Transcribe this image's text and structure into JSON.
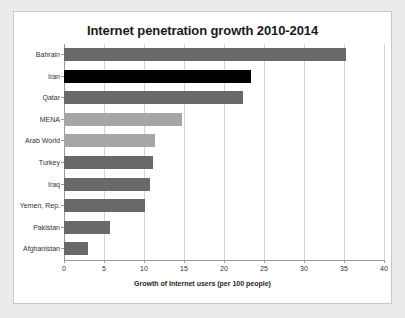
{
  "chart_data": {
    "type": "bar",
    "orientation": "horizontal",
    "title": "Internet penetration growth 2010-2014",
    "xlabel": "Growth of Internet users (per 100 people)",
    "ylabel": "",
    "xlim": [
      0,
      40
    ],
    "xticks": [
      "0",
      "5",
      "10",
      "15",
      "20",
      "25",
      "30",
      "35",
      "40"
    ],
    "grid": true,
    "legend": "none",
    "categories": [
      "Bahrain",
      "Iran",
      "Qatar",
      "MENA",
      "Arab World",
      "Turkey",
      "Iraq",
      "Yemen, Rep.",
      "Pakistan",
      "Afghanistan"
    ],
    "values": [
      35.3,
      23.4,
      22.4,
      14.8,
      11.4,
      11.1,
      10.7,
      10.1,
      5.8,
      3.0
    ],
    "bar_colors": [
      "#696969",
      "#000000",
      "#696969",
      "#a6a6a6",
      "#a6a6a6",
      "#696969",
      "#696969",
      "#696969",
      "#696969",
      "#696969"
    ]
  },
  "colors": {
    "page_background": "#eceaea",
    "card_background": "#ffffff",
    "card_border": "#c9c9c9",
    "gridline": "#d5d5d5",
    "axis": "#9a9a9a",
    "text": "#333333",
    "accent_highlight": "#000000"
  }
}
